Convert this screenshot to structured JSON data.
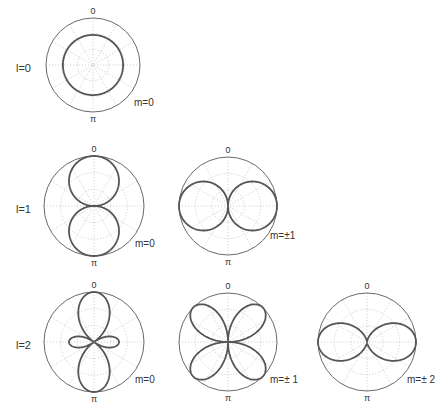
{
  "rows": [
    {
      "label": "l=0",
      "y": 65
    },
    {
      "label": "l=1",
      "y": 206
    },
    {
      "label": "l=2",
      "y": 342
    }
  ],
  "axis_labels": {
    "top": "0",
    "bottom": "π"
  },
  "plots": [
    {
      "id": "l0m0",
      "l": 0,
      "m_label": "m=0",
      "cx": 93,
      "cy": 65,
      "r": 47,
      "shape": "const",
      "scale": 0.64,
      "m_x": 134,
      "m_y": 106
    },
    {
      "id": "l1m0",
      "l": 1,
      "m_label": "m=0",
      "cx": 94,
      "cy": 206,
      "r": 50,
      "shape": "cos",
      "scale": 1.0,
      "m_x": 135,
      "m_y": 247
    },
    {
      "id": "l1m1",
      "l": 1,
      "m_label": "m=±1",
      "cx": 228,
      "cy": 206,
      "r": 49,
      "shape": "sin",
      "scale": 1.0,
      "m_x": 270,
      "m_y": 239
    },
    {
      "id": "l2m0",
      "l": 2,
      "m_label": "m=0",
      "cx": 94,
      "cy": 342,
      "r": 50,
      "shape": "3cos2-1",
      "scale": 1.0,
      "m_x": 135,
      "m_y": 383
    },
    {
      "id": "l2m1",
      "l": 2,
      "m_label": "m=± 1",
      "cx": 228,
      "cy": 342,
      "r": 49,
      "shape": "sincos",
      "scale": 1.0,
      "m_x": 270,
      "m_y": 383
    },
    {
      "id": "l2m2",
      "l": 2,
      "m_label": "m=± 2",
      "cx": 367,
      "cy": 342,
      "r": 49,
      "shape": "sin2",
      "scale": 1.0,
      "m_x": 407,
      "m_y": 383
    }
  ],
  "colors": {
    "outer": "#6a6a6a",
    "grid": "#bdbdbd",
    "curve": "#555555",
    "text": "#333333"
  }
}
